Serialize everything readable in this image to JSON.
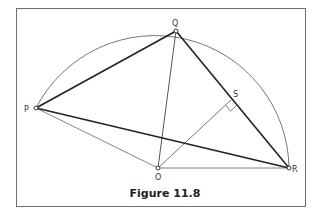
{
  "figure": {
    "caption": "Figure 11.8",
    "points": {
      "P": {
        "label": "P",
        "x": 36,
        "y": 108
      },
      "Q": {
        "label": "Q",
        "x": 176,
        "y": 31
      },
      "R": {
        "label": "R",
        "x": 289,
        "y": 168
      },
      "O": {
        "label": "O",
        "x": 158,
        "y": 168
      },
      "S": {
        "label": "S",
        "x": 231,
        "y": 100
      }
    },
    "colors": {
      "thick_line": "#222222",
      "thin_line": "#777777",
      "arc": "#666666",
      "frame": "#6e6e6e"
    }
  }
}
